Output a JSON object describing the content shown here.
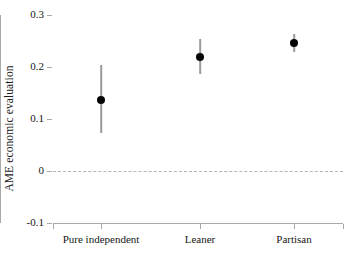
{
  "chart_data": {
    "type": "scatter",
    "title": "",
    "subtitle": "",
    "xlabel": "",
    "ylabel": "AME economic evaluation",
    "categories": [
      "Pure independent",
      "Leaner",
      "Partisan"
    ],
    "series": [
      {
        "name": "AME economic evaluation",
        "values": [
          0.137,
          0.22,
          0.247
        ],
        "ci_low": [
          0.073,
          0.186,
          0.229
        ],
        "ci_high": [
          0.204,
          0.253,
          0.264
        ]
      }
    ],
    "ylim": [
      -0.1,
      0.3
    ],
    "yticks": [
      0.3,
      0.2,
      0.1,
      0,
      -0.1
    ],
    "ytick_labels": [
      "0.3",
      "0.2",
      "0.1",
      "0",
      "-0.1"
    ],
    "grid": false,
    "legend": "none",
    "reference_line": {
      "value": 0,
      "style": "dashed",
      "color": "#b4b4b4"
    },
    "marker": {
      "shape": "circle",
      "color": "#050505",
      "size": 8
    },
    "errorbar": {
      "color": "#9a9a9a",
      "width": 1.6
    },
    "axis_color": "#a9a9a9",
    "background": "#ffffff"
  }
}
